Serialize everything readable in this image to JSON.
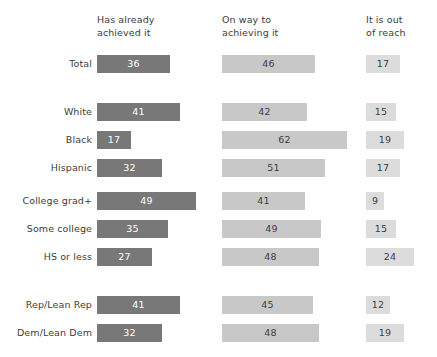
{
  "chart_data": {
    "type": "bar",
    "title": "",
    "xlabel": "",
    "ylabel": "",
    "orientation": "horizontal",
    "grid": false,
    "legend_position": "top (column headers)",
    "xlim": [
      0,
      100
    ],
    "units": "percent",
    "categories": [
      "Total",
      "White",
      "Black",
      "Hispanic",
      "College grad+",
      "Some college",
      "HS or less",
      "Rep/Lean Rep",
      "Dem/Lean Dem"
    ],
    "series": [
      {
        "name": "Has already achieved it",
        "color": "#787878",
        "values": [
          36,
          41,
          17,
          32,
          49,
          35,
          27,
          41,
          32
        ]
      },
      {
        "name": "On way to achieving it",
        "color": "#c8c8c8",
        "values": [
          46,
          42,
          62,
          51,
          41,
          49,
          48,
          45,
          48
        ]
      },
      {
        "name": "It is out of reach",
        "color": "#dcdcdc",
        "values": [
          17,
          15,
          19,
          17,
          9,
          15,
          24,
          12,
          19
        ]
      }
    ]
  },
  "columns": [
    {
      "header": "Has already\nachieved it"
    },
    {
      "header": "On way to\nachieving it"
    },
    {
      "header": "It is out\nof reach"
    }
  ],
  "rows": [
    {
      "label": "Total",
      "values": [
        36,
        46,
        17
      ]
    },
    {
      "label": "White",
      "values": [
        41,
        42,
        15
      ]
    },
    {
      "label": "Black",
      "values": [
        17,
        62,
        19
      ]
    },
    {
      "label": "Hispanic",
      "values": [
        32,
        51,
        17
      ]
    },
    {
      "label": "College grad+",
      "values": [
        49,
        41,
        9
      ]
    },
    {
      "label": "Some college",
      "values": [
        35,
        49,
        15
      ]
    },
    {
      "label": "HS or less",
      "values": [
        27,
        48,
        24
      ]
    },
    {
      "label": "Rep/Lean Rep",
      "values": [
        41,
        45,
        12
      ]
    },
    {
      "label": "Dem/Lean Dem",
      "values": [
        32,
        48,
        19
      ]
    }
  ],
  "layout": {
    "col_x": [
      97,
      222,
      366
    ],
    "row_y": [
      55,
      103,
      131,
      159,
      192,
      220,
      248,
      296,
      324
    ],
    "px_per_unit": 2.02,
    "bar_height": 18,
    "header_y": 14
  },
  "colors": {
    "series1": "#787878",
    "series2": "#c8c8c8",
    "series3": "#dcdcdc",
    "text": "#3d3d3d",
    "value_on_dark": "#ffffff",
    "background": "#ffffff"
  }
}
